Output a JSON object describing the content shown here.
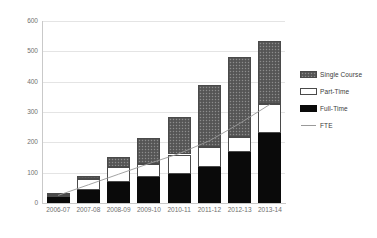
{
  "chart_data": {
    "type": "bar",
    "subtype": "stacked-bar-with-line-overlay",
    "title": "",
    "subtitle": "",
    "xlabel": "",
    "ylabel": "",
    "ylim": [
      0,
      600
    ],
    "ytick_step": 100,
    "ytick_labels": [
      "0",
      "100",
      "200",
      "300",
      "400",
      "500",
      "600"
    ],
    "ytick_values": [
      0,
      100,
      200,
      300,
      400,
      500,
      600
    ],
    "grid": true,
    "grid_axis": "y",
    "legend_position": "right",
    "categories": [
      "2006-07",
      "2007-08",
      "2008-09",
      "2009-10",
      "2010-11",
      "2011-12",
      "2012-13",
      "2013-14"
    ],
    "series": [
      {
        "name": "Full-Time",
        "type": "bar",
        "stack": "enrolment",
        "stack_order": 1,
        "color": "#0a0a0a",
        "fill": "solid-black",
        "values": [
          20,
          42,
          68,
          85,
          97,
          118,
          168,
          230
        ]
      },
      {
        "name": "Part-Time",
        "type": "bar",
        "stack": "enrolment",
        "stack_order": 2,
        "color": "#ffffff",
        "fill": "white-outlined",
        "values": [
          5,
          38,
          52,
          43,
          63,
          68,
          50,
          95
        ]
      },
      {
        "name": "Single Course",
        "type": "bar",
        "stack": "enrolment",
        "stack_order": 3,
        "color": "#5d5d5d",
        "fill": "dark-grey-dotted-texture",
        "values": [
          8,
          10,
          33,
          85,
          125,
          202,
          262,
          208
        ]
      },
      {
        "name": "FTE",
        "type": "line",
        "color": "#9a9a9a",
        "values": [
          25,
          60,
          95,
          130,
          163,
          205,
          262,
          325
        ]
      }
    ],
    "stack_totals": [
      33,
      90,
      153,
      213,
      285,
      388,
      480,
      533
    ]
  },
  "legend": {
    "items": [
      {
        "label": "Single Course",
        "swatch": "single-course-swatch"
      },
      {
        "label": "Part-Time",
        "swatch": "part-time-swatch"
      },
      {
        "label": "Full-Time",
        "swatch": "full-time-swatch"
      },
      {
        "label": "FTE",
        "swatch": "fte-line-swatch"
      }
    ]
  }
}
